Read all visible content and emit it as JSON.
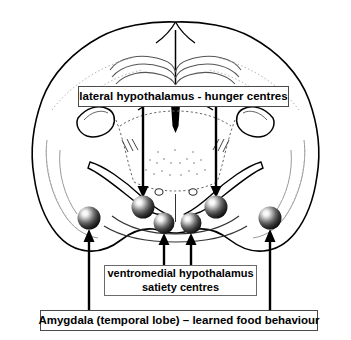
{
  "figure": {
    "background_color": "#ffffff",
    "width": 351,
    "height": 340
  },
  "labels": {
    "lateral_hypothalamus": {
      "text": "lateral hypothalamus - hunger centres",
      "border_color": "#4a4a4a"
    },
    "ventromedial_hypothalamus": {
      "line1": "ventromedial hypothalamus",
      "line2": "satiety centres",
      "border_color": "#6a6a6a"
    },
    "amygdala": {
      "text": "Amygdala (temporal lobe) – learned food behaviour",
      "border_color": "#4a4a4a"
    }
  },
  "markers": {
    "color_dark": "#1a1a1a",
    "color_mid": "#4d4d4d",
    "color_highlight": "#ffffff",
    "items": [
      {
        "name": "amygdala-left",
        "cx": 89,
        "cy": 218,
        "r": 11.5
      },
      {
        "name": "lateral-hypothalamus-left",
        "cx": 143,
        "cy": 207,
        "r": 11.5
      },
      {
        "name": "ventromedial-hypothalamus-left",
        "cx": 164,
        "cy": 223,
        "r": 10.5
      },
      {
        "name": "ventromedial-hypothalamus-right",
        "cx": 191,
        "cy": 223,
        "r": 10.5
      },
      {
        "name": "lateral-hypothalamus-right",
        "cx": 216,
        "cy": 207,
        "r": 11.5
      },
      {
        "name": "amygdala-right",
        "cx": 270,
        "cy": 218,
        "r": 11.5
      }
    ]
  },
  "arrows": {
    "color": "#000000",
    "items": [
      {
        "name": "arrow-lateral-hypothalamus-left",
        "direction": "down",
        "x": 143,
        "from_y": 107,
        "to_y": 195
      },
      {
        "name": "arrow-lateral-hypothalamus-right",
        "direction": "down",
        "x": 216,
        "from_y": 107,
        "to_y": 195
      },
      {
        "name": "arrow-ventromedial-left",
        "direction": "up",
        "x": 164,
        "from_y": 265,
        "to_y": 234
      },
      {
        "name": "arrow-ventromedial-right",
        "direction": "up",
        "x": 191,
        "from_y": 265,
        "to_y": 234
      },
      {
        "name": "arrow-amygdala-left",
        "direction": "up",
        "x": 89,
        "from_y": 310,
        "to_y": 230
      },
      {
        "name": "arrow-amygdala-right",
        "direction": "up",
        "x": 270,
        "from_y": 310,
        "to_y": 230
      }
    ]
  },
  "anatomy": {
    "outline_color": "#000000",
    "detail_color": "#555555",
    "faint_color": "#9a9a9a",
    "structures": [
      "cerebral cortex outline",
      "interhemispheric fissure",
      "corpus callosum",
      "lateral ventricles",
      "thalamus",
      "internal capsule",
      "optic tract",
      "third ventricle",
      "fornix"
    ]
  }
}
